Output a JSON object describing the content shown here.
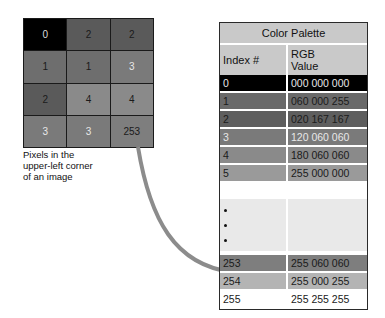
{
  "grid": {
    "caption": [
      "Pixels in the",
      "upper-left corner",
      "of an image"
    ],
    "cells": [
      {
        "value": "0",
        "bg": "#000000",
        "fg": "#dddddd"
      },
      {
        "value": "2",
        "bg": "#5a5a5a",
        "fg": "#1a1a1a"
      },
      {
        "value": "2",
        "bg": "#5a5a5a",
        "fg": "#1a1a1a"
      },
      {
        "value": "1",
        "bg": "#6e6e6e",
        "fg": "#1a1a1a"
      },
      {
        "value": "1",
        "bg": "#6e6e6e",
        "fg": "#1a1a1a"
      },
      {
        "value": "3",
        "bg": "#7a7a7a",
        "fg": "#e8e8e8"
      },
      {
        "value": "2",
        "bg": "#5a5a5a",
        "fg": "#1a1a1a"
      },
      {
        "value": "4",
        "bg": "#8a8a8a",
        "fg": "#1a1a1a"
      },
      {
        "value": "4",
        "bg": "#8a8a8a",
        "fg": "#1a1a1a"
      },
      {
        "value": "3",
        "bg": "#7a7a7a",
        "fg": "#e8e8e8"
      },
      {
        "value": "3",
        "bg": "#7a7a7a",
        "fg": "#e8e8e8"
      },
      {
        "value": "253",
        "bg": "#7e7e7e",
        "fg": "#1a1a1a"
      }
    ]
  },
  "palette": {
    "title": "Color Palette",
    "header_index": "Index #",
    "header_rgb_1": "RGB",
    "header_rgb_2": "Value",
    "rows": [
      {
        "index": "0",
        "rgb": "000 000 000",
        "bg": "#000000",
        "fg": "#e6e6e6",
        "top": 52
      },
      {
        "index": "1",
        "rgb": "060 000 255",
        "bg": "#6a6a6a",
        "fg": "#1a1a1a",
        "top": 70
      },
      {
        "index": "2",
        "rgb": "020 167 167",
        "bg": "#5e5e5e",
        "fg": "#1a1a1a",
        "top": 88
      },
      {
        "index": "3",
        "rgb": "120 060 060",
        "bg": "#7a7a7a",
        "fg": "#e8e8e8",
        "top": 106
      },
      {
        "index": "4",
        "rgb": "180 060 060",
        "bg": "#8a8a8a",
        "fg": "#1a1a1a",
        "top": 124
      },
      {
        "index": "5",
        "rgb": "255 000 000",
        "bg": "#9a9a9a",
        "fg": "#1a1a1a",
        "top": 142
      },
      {
        "index": "253",
        "rgb": "255 060 060",
        "bg": "#7e7e7e",
        "fg": "#1a1a1a",
        "top": 232
      },
      {
        "index": "254",
        "rgb": "255 000 255",
        "bg": "#b4b4b4",
        "fg": "#1a1a1a",
        "top": 250
      },
      {
        "index": "255",
        "rgb": "255 255 255",
        "bg": "#ffffff",
        "fg": "#1a1a1a",
        "top": 268
      }
    ]
  }
}
